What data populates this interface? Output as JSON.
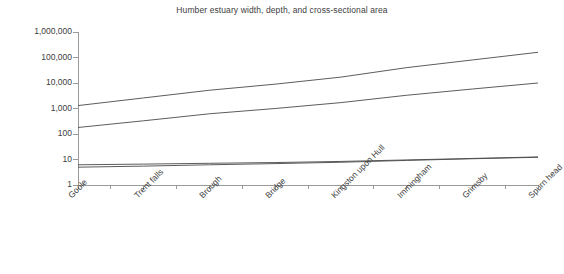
{
  "chart_data": {
    "type": "line",
    "title": "Humber estuary width, depth, and cross-sectional area",
    "xlabel": "",
    "ylabel": "",
    "yscale": "log",
    "ylim": [
      1,
      1000000
    ],
    "grid": false,
    "legend": "none",
    "categories": [
      "Goole",
      "Trent falls",
      "Brough",
      "Bridge",
      "Kingston upon Hull",
      "Immingham",
      "Grimsby",
      "Spurn head"
    ],
    "ytick_labels": [
      "1",
      "10",
      "100",
      "1,000",
      "10,000",
      "100,000",
      "1,000,000"
    ],
    "ytick_values": [
      1,
      10,
      100,
      1000,
      10000,
      100000,
      1000000
    ],
    "series": [
      {
        "name": "cross-sectional area",
        "values": [
          1300,
          2600,
          5200,
          9000,
          17000,
          40000,
          80000,
          160000
        ]
      },
      {
        "name": "width",
        "values": [
          180,
          330,
          620,
          1000,
          1700,
          3300,
          5800,
          10000
        ]
      },
      {
        "name": "depth (upper)",
        "values": [
          6.2,
          6.6,
          7.1,
          7.6,
          8.4,
          9.6,
          11.0,
          12.6
        ]
      },
      {
        "name": "depth (lower)",
        "values": [
          5.0,
          5.5,
          6.2,
          6.9,
          7.8,
          9.2,
          10.7,
          12.2
        ]
      }
    ]
  },
  "colors": {
    "background": "#ffffff",
    "line": "#4a4a4a",
    "axis": "#9a9a9a",
    "text": "#3d3d3d"
  }
}
